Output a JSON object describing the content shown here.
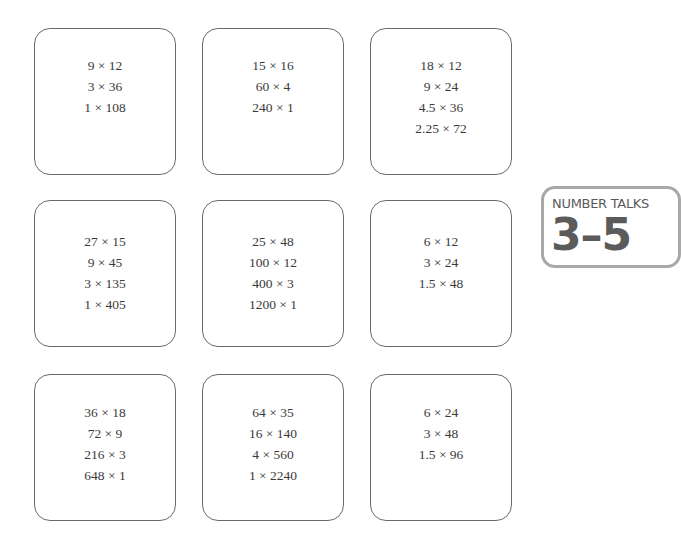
{
  "badge": {
    "label": "NUMBER TALKS",
    "grade_range": "3–5"
  },
  "cards": [
    {
      "lines": [
        "9 × 12",
        "3 × 36",
        "1 × 108"
      ]
    },
    {
      "lines": [
        "15 × 16",
        "60 × 4",
        "240 × 1"
      ]
    },
    {
      "lines": [
        "18 × 12",
        "9 × 24",
        "4.5 × 36",
        "2.25 × 72"
      ]
    },
    {
      "lines": [
        "27 × 15",
        "9 × 45",
        "3 × 135",
        "1 × 405"
      ]
    },
    {
      "lines": [
        "25 × 48",
        "100 × 12",
        "400 × 3",
        "1200 × 1"
      ]
    },
    {
      "lines": [
        "6 × 12",
        "3 × 24",
        "1.5 × 48"
      ]
    },
    {
      "lines": [
        "36 × 18",
        "72 × 9",
        "216 × 3",
        "648 × 1"
      ]
    },
    {
      "lines": [
        "64 × 35",
        "16 × 140",
        "4 × 560",
        "1 × 2240"
      ]
    },
    {
      "lines": [
        "6 × 24",
        "3 × 48",
        "1.5 × 96"
      ]
    }
  ]
}
